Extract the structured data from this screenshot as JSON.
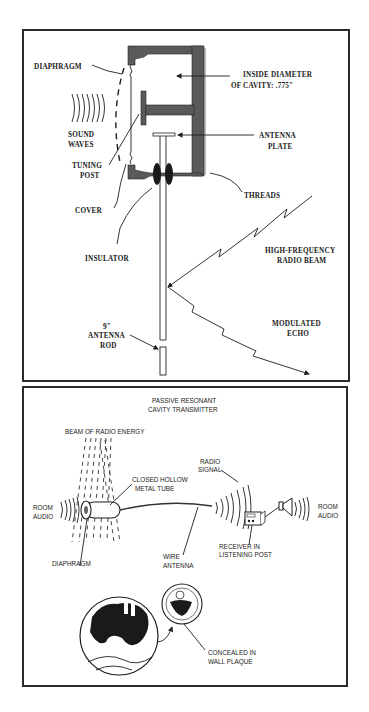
{
  "figure_top": {
    "labels": {
      "diaphragm": "DIAPHRAGM",
      "inside_diameter_1": "INSIDE DIAMETER",
      "inside_diameter_2": "OF CAVITY: .775\"",
      "sound_waves_1": "SOUND",
      "sound_waves_2": "WAVES",
      "antenna_plate_1": "ANTENNA",
      "antenna_plate_2": "PLATE",
      "tuning_post_1": "TUNING",
      "tuning_post_2": "POST",
      "threads": "THREADS",
      "cover": "COVER",
      "insulator": "INSULATOR",
      "hf_beam_1": "HIGH-FREQUENCY",
      "hf_beam_2": "RADIO BEAM",
      "antenna_rod_1": "9\"",
      "antenna_rod_2": "ANTENNA",
      "antenna_rod_3": "ROD",
      "modulated_echo_1": "MODULATED",
      "modulated_echo_2": "ECHO"
    },
    "colors": {
      "metal": "#5a5a5a",
      "ink": "#1e1e1e"
    }
  },
  "figure_bottom": {
    "title_1": "PASSIVE RESONANT",
    "title_2": "CAVITY TRANSMITTER",
    "labels": {
      "beam": "BEAM OF RADIO ENERGY",
      "radio_signal_1": "RADIO",
      "radio_signal_2": "SIGNAL",
      "tube_1": "CLOSED HOLLOW",
      "tube_2": "METAL TUBE",
      "room_audio_left_1": "ROOM",
      "room_audio_left_2": "AUDIO",
      "room_audio_right_1": "ROOM",
      "room_audio_right_2": "AUDIO",
      "diaphragm": "DIAPHRAGM",
      "wire_antenna_1": "WIRE",
      "wire_antenna_2": "ANTENNA",
      "receiver_1": "RECEIVER IN",
      "receiver_2": "LISTENING POST",
      "concealed_1": "CONCEALED IN",
      "concealed_2": "WALL PLAQUE"
    }
  }
}
